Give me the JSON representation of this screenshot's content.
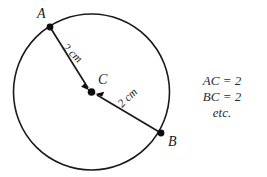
{
  "figure": {
    "background_color": "#ffffff",
    "stroke_color": "#1a1a1a",
    "text_color": "#2b2b2b"
  },
  "circle": {
    "center_x": 91.5,
    "center_y": 92,
    "radius": 78
  },
  "points": {
    "a": {
      "label": "A",
      "x": 50,
      "y": 27,
      "label_x": 37,
      "label_y": 18
    },
    "b": {
      "label": "B",
      "x": 161,
      "y": 133,
      "label_x": 168,
      "label_y": 146
    },
    "c": {
      "label": "C",
      "x": 91.5,
      "y": 92,
      "label_x": 98,
      "label_y": 84
    }
  },
  "measures": {
    "ac": {
      "text": "2 cm",
      "x": 62,
      "y": 48,
      "rotation": 44
    },
    "bc": {
      "text": "2 cm",
      "x": 122,
      "y": 108,
      "rotation": -44
    }
  },
  "notes": {
    "x": 222,
    "lines": [
      {
        "text": "AC = 2",
        "y": 85
      },
      {
        "text": "BC = 2",
        "y": 101
      },
      {
        "text": "etc.",
        "y": 117
      }
    ]
  }
}
